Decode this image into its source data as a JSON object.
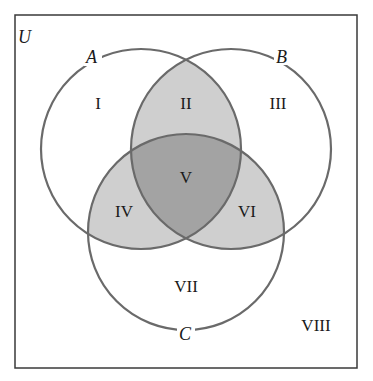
{
  "diagram": {
    "type": "venn-3-set",
    "universe_label": "U",
    "sets": [
      {
        "name": "A",
        "cx": 141,
        "cy": 149,
        "r": 100
      },
      {
        "name": "B",
        "cx": 231,
        "cy": 149,
        "r": 100
      },
      {
        "name": "C",
        "cx": 186,
        "cy": 232,
        "r": 98
      }
    ],
    "regions": [
      {
        "id": "I",
        "label": "I",
        "description": "A only",
        "shaded": false
      },
      {
        "id": "II",
        "label": "II",
        "description": "A and B, not C",
        "shaded": true
      },
      {
        "id": "III",
        "label": "III",
        "description": "B only",
        "shaded": false
      },
      {
        "id": "IV",
        "label": "IV",
        "description": "A and C, not B",
        "shaded": true
      },
      {
        "id": "V",
        "label": "V",
        "description": "A and B and C",
        "shaded": true,
        "dark": true
      },
      {
        "id": "VI",
        "label": "VI",
        "description": "B and C, not A",
        "shaded": true
      },
      {
        "id": "VII",
        "label": "VII",
        "description": "C only",
        "shaded": false
      },
      {
        "id": "VIII",
        "label": "VIII",
        "description": "outside A, B, C",
        "shaded": false
      }
    ],
    "colors": {
      "light_shade": "#cfcfcf",
      "dark_shade": "#a3a3a3",
      "outline": "#6a6a6a",
      "border": "#3a3a3a"
    }
  }
}
